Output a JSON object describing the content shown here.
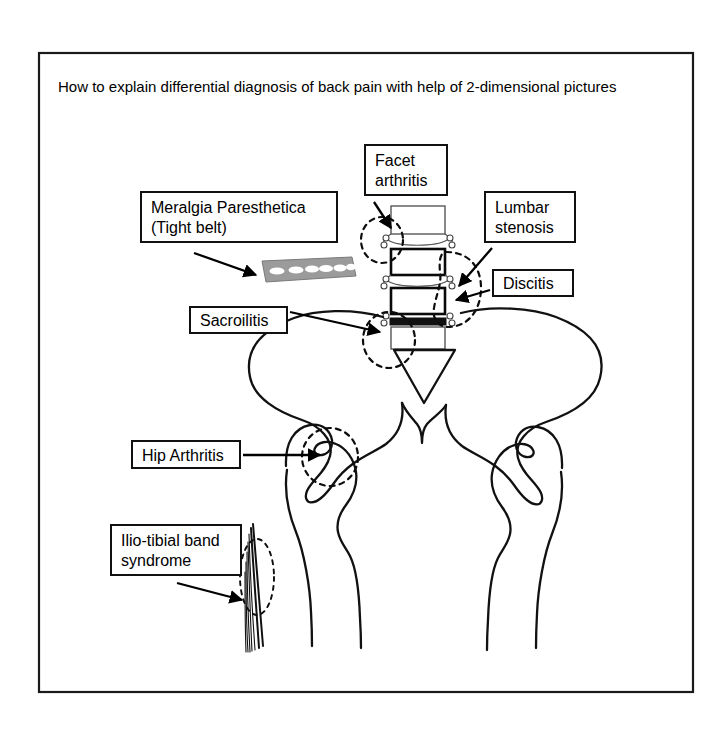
{
  "figure": {
    "title": "How to explain differential diagnosis of back pain with help of 2-dimensional pictures",
    "title_font_px": 15,
    "border_color": "#1a1a1a",
    "background": "#ffffff",
    "line_color": "#111111",
    "highlight_style": "dashed-ellipse"
  },
  "callouts": [
    {
      "id": "meralgia",
      "label": "Meralgia Paresthetica\n(Tight belt)",
      "font_px": 16,
      "x": 140,
      "y": 191,
      "w": 198,
      "h": 52,
      "points_to": "belt"
    },
    {
      "id": "facet",
      "label": "Facet\narthritis",
      "font_px": 16,
      "x": 364,
      "y": 144,
      "w": 84,
      "h": 52,
      "points_to": "facet-joint"
    },
    {
      "id": "stenosis",
      "label": "Lumbar\nstenosis",
      "font_px": 16,
      "x": 484,
      "y": 191,
      "w": 92,
      "h": 52,
      "points_to": "spinal-canal"
    },
    {
      "id": "discitis",
      "label": "Discitis",
      "font_px": 16,
      "x": 492,
      "y": 269,
      "w": 82,
      "h": 28,
      "points_to": "intervertebral-disc"
    },
    {
      "id": "sacroiliitis",
      "label": "Sacroilitis",
      "font_px": 16,
      "x": 189,
      "y": 306,
      "w": 99,
      "h": 28,
      "points_to": "sacroiliac-joint"
    },
    {
      "id": "hip",
      "label": "Hip Arthritis",
      "font_px": 16,
      "x": 131,
      "y": 440,
      "w": 110,
      "h": 29,
      "points_to": "hip-joint"
    },
    {
      "id": "itband",
      "label": "Ilio-tibial band\nsyndrome",
      "font_px": 16,
      "x": 110,
      "y": 524,
      "w": 132,
      "h": 52,
      "points_to": "iliotibial-band"
    }
  ],
  "anatomy": {
    "spine": {
      "name": "lumbar-spine",
      "vertebra_count": 4,
      "vertebrae": [
        {
          "index": 1,
          "fill": "white",
          "label": "vertebral-body-1"
        },
        {
          "index": 2,
          "fill": "grey-lower",
          "label": "vertebral-body-2"
        },
        {
          "index": 3,
          "fill": "grey-upper",
          "label": "vertebral-body-3"
        },
        {
          "index": 4,
          "fill": "white",
          "label": "vertebral-body-4"
        }
      ],
      "black_disc_index": 3,
      "black_disc_name": "infected-disc"
    },
    "sacrum": {
      "name": "sacrum",
      "shape": "inverted-triangle"
    },
    "pelvis": {
      "name": "pelvic-girdle",
      "sides": [
        "left-ilium",
        "right-ilium"
      ]
    },
    "femurs": {
      "name": "femurs",
      "count": 2
    },
    "belt": {
      "name": "tight-belt",
      "hole_count": 8,
      "fill": "#9b9b9b"
    },
    "iliotibial_band": {
      "name": "iliotibial-band",
      "strand_count": 7
    }
  }
}
